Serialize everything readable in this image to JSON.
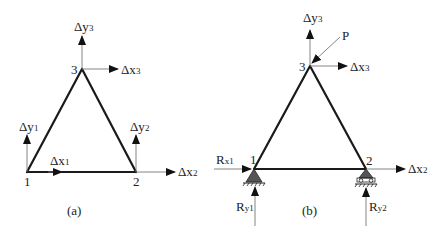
{
  "figure": {
    "panels": [
      {
        "id": "a",
        "caption": "(a)",
        "nodes": [
          {
            "id": "1",
            "label": "1"
          },
          {
            "id": "2",
            "label": "2"
          },
          {
            "id": "3",
            "label": "3"
          }
        ],
        "dof_labels": {
          "dx1": {
            "main": "Δx",
            "sub": "1"
          },
          "dy1": {
            "main": "Δy",
            "sub": "1"
          },
          "dx2": {
            "main": "Δx",
            "sub": "2"
          },
          "dy2": {
            "main": "Δy",
            "sub": "2"
          },
          "dx3": {
            "main": "Δx",
            "sub": "3"
          },
          "dy3": {
            "main": "Δy",
            "sub": "3"
          }
        }
      },
      {
        "id": "b",
        "caption": "(b)",
        "nodes": [
          {
            "id": "1",
            "label": "1"
          },
          {
            "id": "2",
            "label": "2"
          },
          {
            "id": "3",
            "label": "3"
          }
        ],
        "dof_labels": {
          "dx2": {
            "main": "Δx",
            "sub": "2"
          },
          "dx3": {
            "main": "Δx",
            "sub": "3"
          },
          "dy3": {
            "main": "Δy",
            "sub": "3"
          }
        },
        "load": {
          "label": "P"
        },
        "reactions": {
          "rx1": {
            "main": "R",
            "sub": "x1"
          },
          "ry1": {
            "main": "R",
            "sub": "y1"
          },
          "ry2": {
            "main": "R",
            "sub": "y2"
          }
        },
        "supports": [
          {
            "node": "1",
            "type": "pin"
          },
          {
            "node": "2",
            "type": "roller"
          }
        ]
      }
    ]
  }
}
